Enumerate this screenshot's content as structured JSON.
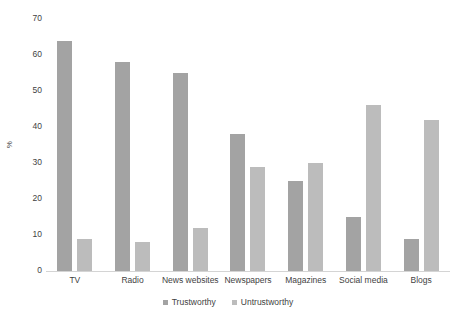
{
  "chart_data": {
    "type": "bar",
    "title": "",
    "subtitle": "",
    "xlabel": "",
    "ylabel": "%",
    "ylim": [
      0,
      70
    ],
    "ytick_step": 10,
    "yticks": [
      "70",
      "60",
      "50",
      "40",
      "30",
      "20",
      "10",
      "0"
    ],
    "grid": false,
    "legend_position": "bottom-center",
    "categories": [
      "TV",
      "Radio",
      "News websites",
      "Newspapers",
      "Magazines",
      "Social media",
      "Blogs"
    ],
    "series": [
      {
        "name": "Trustworthy",
        "color": "#a3a3a3",
        "values": [
          64,
          58,
          55,
          38,
          25,
          15,
          9
        ]
      },
      {
        "name": "Untrustworthy",
        "color": "#bcbcbc",
        "values": [
          9,
          8,
          12,
          29,
          30,
          46,
          42
        ]
      }
    ]
  },
  "legend": {
    "items": [
      {
        "label": "Trustworthy",
        "color": "#a3a3a3"
      },
      {
        "label": "Untrustworthy",
        "color": "#bcbcbc"
      }
    ]
  }
}
